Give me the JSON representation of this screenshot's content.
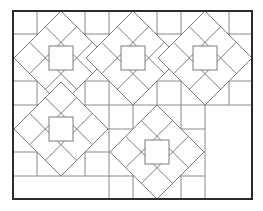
{
  "figure": {
    "kind": "quilt-pattern-line-drawing",
    "background": "#ffffff",
    "line_color": "#7a7a7a",
    "frame_color": "#2b2b2b",
    "frame": {
      "x": 13,
      "y": 11,
      "width": 239,
      "height": 188
    },
    "grid": {
      "columns_x": [
        13,
        37,
        61,
        85,
        109,
        133,
        157,
        181,
        205,
        229,
        252
      ],
      "rows_y": [
        11,
        34,
        58,
        81,
        105,
        129,
        152,
        176,
        199
      ]
    },
    "blocks": [
      {
        "name": "block-1",
        "cx": 61,
        "cy": 58,
        "r": 47,
        "inner_square": 24
      },
      {
        "name": "block-2",
        "cx": 133,
        "cy": 58,
        "r": 47,
        "inner_square": 24
      },
      {
        "name": "block-3",
        "cx": 205,
        "cy": 58,
        "r": 47,
        "inner_square": 24
      },
      {
        "name": "block-4",
        "cx": 61,
        "cy": 129,
        "r": 47,
        "inner_square": 24
      },
      {
        "name": "block-5",
        "cx": 157,
        "cy": 152,
        "r": 47,
        "inner_square": 24
      }
    ],
    "empty_regions": [
      {
        "name": "bottom-right-open-panel",
        "x": 205,
        "y": 105,
        "width": 47,
        "height": 94
      },
      {
        "name": "bottom-left-open-strip",
        "x": 13,
        "y": 176,
        "width": 96,
        "height": 23
      }
    ]
  }
}
